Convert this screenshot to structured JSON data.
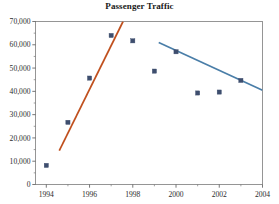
{
  "chart_data": {
    "type": "scatter",
    "title": "Passenger Traffic",
    "xlabel": "",
    "ylabel": "",
    "x": [
      1994,
      1995,
      1996,
      1997,
      1998,
      1999,
      2000,
      2001,
      2002,
      2003
    ],
    "values": [
      8200,
      26700,
      45700,
      64000,
      61700,
      48700,
      57000,
      39300,
      39700,
      44700
    ],
    "series": [
      {
        "name": "Passenger Traffic",
        "marker": "square",
        "color": "#3e4e6e",
        "x": [
          1994,
          1995,
          1996,
          1997,
          1998,
          1999,
          2000,
          2001,
          2002,
          2003
        ],
        "values": [
          8200,
          26700,
          45700,
          64000,
          61700,
          48700,
          57000,
          39300,
          39700,
          44700
        ]
      },
      {
        "name": "growth-trendline",
        "type": "line",
        "color": "#c0501e",
        "x": [
          1994.6,
          1997.55
        ],
        "values": [
          14600,
          70000
        ]
      },
      {
        "name": "decline-trendline",
        "type": "line",
        "color": "#4a7ea8",
        "x": [
          1999.2,
          2004.0
        ],
        "values": [
          61000,
          40500
        ]
      }
    ],
    "xlim": [
      1993.5,
      2004
    ],
    "ylim": [
      0,
      70000
    ],
    "xticks": [
      1994,
      1996,
      1998,
      2000,
      2002,
      2004
    ],
    "xtick_labels": [
      "1994",
      "1996",
      "1998",
      "2000",
      "2002",
      "2004"
    ],
    "xminor_ticks": [
      1995,
      1997,
      1999,
      2001,
      2003
    ],
    "yticks": [
      0,
      10000,
      20000,
      30000,
      40000,
      50000,
      60000,
      70000
    ],
    "ytick_labels": [
      "0",
      "10,000",
      "20,000",
      "30,000",
      "40,000",
      "50,000",
      "60,000",
      "70,000"
    ],
    "grid": false,
    "legend": null,
    "frame_color": "#8a8a8a",
    "background": "#ffffff"
  }
}
